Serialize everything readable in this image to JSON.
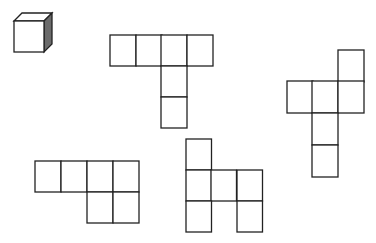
{
  "figure": {
    "stroke_color": "#222222",
    "shade_color": "#6b6b6b",
    "cube": {
      "front": [
        14,
        21,
        30,
        31
      ],
      "depth": 8
    },
    "nets": [
      {
        "id": "net-a",
        "cells": [
          [
            110,
            35
          ],
          [
            136,
            35
          ],
          [
            161,
            35
          ],
          [
            187,
            35
          ],
          [
            161,
            66
          ],
          [
            161,
            97
          ]
        ],
        "w": 26,
        "h": 31
      },
      {
        "id": "net-b",
        "cells": [
          [
            338,
            50
          ],
          [
            287,
            81
          ],
          [
            312,
            81
          ],
          [
            338,
            81
          ],
          [
            312,
            113
          ],
          [
            312,
            145
          ]
        ],
        "w": 26,
        "h": 32
      },
      {
        "id": "net-c",
        "cells": [
          [
            35,
            161
          ],
          [
            61,
            161
          ],
          [
            87,
            161
          ],
          [
            113,
            161
          ],
          [
            87,
            192
          ],
          [
            113,
            192
          ]
        ],
        "w": 26,
        "h": 31
      },
      {
        "id": "net-d",
        "cells": [
          [
            186,
            139
          ],
          [
            186,
            170
          ],
          [
            211,
            170
          ],
          [
            237,
            170
          ],
          [
            186,
            201
          ],
          [
            237,
            201
          ]
        ],
        "w": 25.5,
        "h": 31
      }
    ]
  }
}
